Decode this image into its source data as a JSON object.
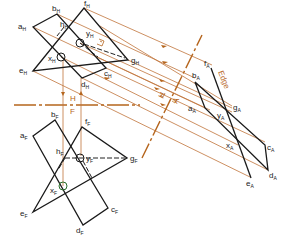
{
  "diagram": {
    "colors": {
      "object_line": "#1a1a1a",
      "projection_line": "#c0733a",
      "fold_line": "#b5651d",
      "hidden_line": "#333333",
      "circle_marker": "#2a6e2a"
    },
    "fold_lines": {
      "hf": {
        "upper_label": "H",
        "lower_label": "F"
      },
      "ha": {
        "label_left": "H",
        "label_right": "A"
      }
    },
    "edge_label": "Edge",
    "views": {
      "top": {
        "suffix": "H",
        "points": {
          "a": {
            "base": "a",
            "sub": "H"
          },
          "b": {
            "base": "b",
            "sub": "H"
          },
          "c": {
            "base": "c",
            "sub": "H"
          },
          "d": {
            "base": "d",
            "sub": "H"
          },
          "e": {
            "base": "e",
            "sub": "H"
          },
          "f": {
            "base": "f",
            "sub": "H"
          },
          "g": {
            "base": "g",
            "sub": "H"
          },
          "h": {
            "base": "h",
            "sub": "H"
          },
          "x": {
            "base": "x",
            "sub": "H"
          },
          "y": {
            "base": "y",
            "sub": "H"
          }
        }
      },
      "front": {
        "suffix": "F",
        "points": {
          "a": {
            "base": "a",
            "sub": "F"
          },
          "b": {
            "base": "b",
            "sub": "F"
          },
          "c": {
            "base": "c",
            "sub": "F"
          },
          "d": {
            "base": "d",
            "sub": "F"
          },
          "e": {
            "base": "e",
            "sub": "F"
          },
          "f": {
            "base": "f",
            "sub": "F"
          },
          "g": {
            "base": "g",
            "sub": "F"
          },
          "h": {
            "base": "h",
            "sub": "F"
          },
          "x": {
            "base": "x",
            "sub": "F"
          },
          "y": {
            "base": "y",
            "sub": "F"
          }
        }
      },
      "auxiliary": {
        "suffix": "A",
        "points": {
          "a": {
            "base": "a",
            "sub": "A"
          },
          "b": {
            "base": "b",
            "sub": "A"
          },
          "c": {
            "base": "c",
            "sub": "A"
          },
          "d": {
            "base": "d",
            "sub": "A"
          },
          "e": {
            "base": "e",
            "sub": "A"
          },
          "f": {
            "base": "f",
            "sub": "A"
          },
          "g": {
            "base": "g",
            "sub": "A"
          },
          "x": {
            "base": "x",
            "sub": "A"
          },
          "y": {
            "base": "y",
            "sub": "A"
          }
        }
      }
    },
    "perpendicular_mark": "⊥"
  }
}
